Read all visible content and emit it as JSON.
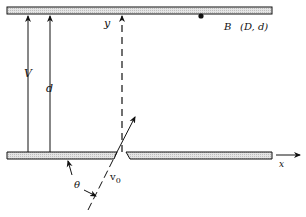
{
  "diagram": {
    "labels": {
      "y_axis": "y",
      "x_axis": "x",
      "point_B": "B",
      "point_B_coords": "(D, d)",
      "potential": "V",
      "separation": "d",
      "angle": "θ",
      "velocity": "v",
      "velocity_sub": "0"
    },
    "colors": {
      "line": "#111111",
      "plate_fill": "#d9d9d9",
      "background": "#ffffff"
    }
  }
}
